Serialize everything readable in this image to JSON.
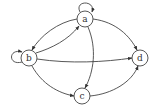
{
  "diagram": {
    "type": "directed-graph",
    "nodes": [
      {
        "id": "a",
        "label": "a",
        "x": 85,
        "y": 19
      },
      {
        "id": "b",
        "label": "b",
        "x": 29,
        "y": 58
      },
      {
        "id": "c",
        "label": "c",
        "x": 82,
        "y": 96
      },
      {
        "id": "d",
        "label": "d",
        "x": 140,
        "y": 58
      }
    ],
    "edges": [
      {
        "from": "a",
        "to": "a",
        "kind": "self-loop"
      },
      {
        "from": "b",
        "to": "b",
        "kind": "self-loop"
      },
      {
        "from": "a",
        "to": "b"
      },
      {
        "from": "b",
        "to": "a"
      },
      {
        "from": "a",
        "to": "d"
      },
      {
        "from": "a",
        "to": "c"
      },
      {
        "from": "b",
        "to": "d"
      },
      {
        "from": "b",
        "to": "c"
      },
      {
        "from": "c",
        "to": "d"
      }
    ],
    "colors": {
      "stroke": "#444444",
      "background": "#ffffff"
    }
  }
}
